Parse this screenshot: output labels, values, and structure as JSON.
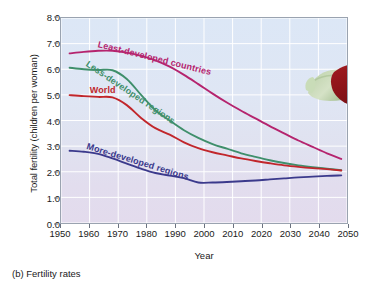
{
  "caption": "(b) Fertility rates",
  "colors": {
    "least_developed": "#b5246e",
    "less_developed": "#3f8f6b",
    "world": "#c1262b",
    "more_developed": "#3b3a8c",
    "plot_border": "#9aa3b0",
    "gridline": "#ffffff",
    "background_top": "#dce7f6",
    "background_bottom": "#e3dbed"
  },
  "photo": {
    "alt_name": "baby-photo",
    "description": "Smiling baby lying on stomach"
  },
  "chart_data": {
    "type": "line",
    "title": "",
    "xlabel": "Year",
    "ylabel": "Total fertility (children per woman)",
    "xlim": [
      1950,
      2050
    ],
    "ylim": [
      0.0,
      8.0
    ],
    "grid": true,
    "legend": "inline-curve-labels",
    "xticks": [
      1950,
      1960,
      1970,
      1980,
      1990,
      2000,
      2010,
      2020,
      2030,
      2040,
      2050
    ],
    "yticks": [
      "0.0",
      "1.0",
      "2.0",
      "3.0",
      "4.0",
      "5.0",
      "6.0",
      "7.0",
      "8.0"
    ],
    "x": [
      1953,
      1958,
      1963,
      1968,
      1973,
      1978,
      1983,
      1988,
      1993,
      1998,
      2003,
      2008,
      2013,
      2018,
      2023,
      2028,
      2033,
      2038,
      2043,
      2048
    ],
    "series": [
      {
        "name": "Least-developed countries",
        "color": "#b5246e",
        "label_x": 1963,
        "label_y": 7.0,
        "label_angle": 14,
        "values": [
          6.62,
          6.68,
          6.72,
          6.72,
          6.65,
          6.52,
          6.35,
          6.1,
          5.78,
          5.42,
          5.05,
          4.7,
          4.38,
          4.08,
          3.78,
          3.5,
          3.22,
          2.97,
          2.72,
          2.5
        ]
      },
      {
        "name": "Less-developed regions",
        "color": "#3f8f6b",
        "label_x": 1959,
        "label_y": 6.25,
        "label_angle": 34,
        "values": [
          6.06,
          6.0,
          5.97,
          5.96,
          5.62,
          5.0,
          4.4,
          4.0,
          3.62,
          3.32,
          3.08,
          2.9,
          2.72,
          2.58,
          2.45,
          2.34,
          2.25,
          2.18,
          2.12,
          2.06
        ]
      },
      {
        "name": "World",
        "color": "#c1262b",
        "label_x": 1960,
        "label_y": 5.22,
        "label_angle": 0,
        "values": [
          4.99,
          4.95,
          4.92,
          4.9,
          4.6,
          4.1,
          3.7,
          3.45,
          3.15,
          2.92,
          2.76,
          2.64,
          2.52,
          2.42,
          2.33,
          2.25,
          2.19,
          2.14,
          2.1,
          2.05
        ]
      },
      {
        "name": "More-developed regions",
        "color": "#3b3a8c",
        "label_x": 1959,
        "label_y": 3.05,
        "label_angle": 17,
        "values": [
          2.82,
          2.78,
          2.7,
          2.52,
          2.32,
          2.12,
          1.95,
          1.85,
          1.75,
          1.58,
          1.58,
          1.6,
          1.63,
          1.66,
          1.7,
          1.74,
          1.78,
          1.81,
          1.84,
          1.86
        ]
      }
    ]
  }
}
